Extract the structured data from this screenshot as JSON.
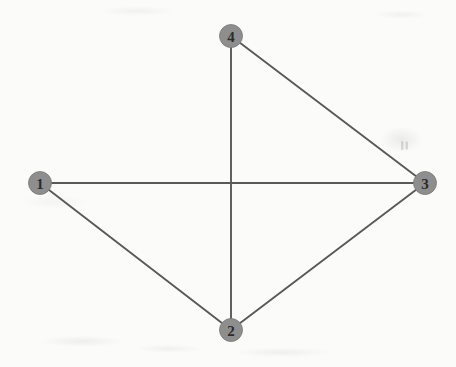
{
  "diagram": {
    "type": "node-link-graph",
    "width": 456,
    "height": 367,
    "background_color": "#fbfbfa",
    "node_fill_color": "#8e8e8e",
    "node_stroke_color": "#7a7a7a",
    "node_label_color": "#2b2b2b",
    "edge_color": "#595959",
    "edge_width": 1.9,
    "node_radius": 11.5,
    "nodes": [
      {
        "id": "1",
        "label": "1",
        "x": 40,
        "y": 183
      },
      {
        "id": "2",
        "label": "2",
        "x": 231,
        "y": 330
      },
      {
        "id": "3",
        "label": "3",
        "x": 425,
        "y": 183
      },
      {
        "id": "4",
        "label": "4",
        "x": 231,
        "y": 36
      }
    ],
    "edges": [
      {
        "id": "edge-1-3",
        "from": "1",
        "to": "3",
        "x1": 40,
        "y1": 183,
        "x2": 425,
        "y2": 183
      },
      {
        "id": "edge-4-2",
        "from": "4",
        "to": "2",
        "x1": 231,
        "y1": 36,
        "x2": 231,
        "y2": 330
      },
      {
        "id": "edge-4-3",
        "from": "4",
        "to": "3",
        "x1": 231,
        "y1": 36,
        "x2": 425,
        "y2": 183
      },
      {
        "id": "edge-1-2",
        "from": "1",
        "to": "2",
        "x1": 40,
        "y1": 183,
        "x2": 231,
        "y2": 330
      },
      {
        "id": "edge-2-3",
        "from": "2",
        "to": "3",
        "x1": 231,
        "y1": 330,
        "x2": 425,
        "y2": 183
      }
    ],
    "artifacts": [
      {
        "id": "smudge-right",
        "x": 401,
        "y": 141,
        "width": 7,
        "height": 9
      }
    ]
  }
}
